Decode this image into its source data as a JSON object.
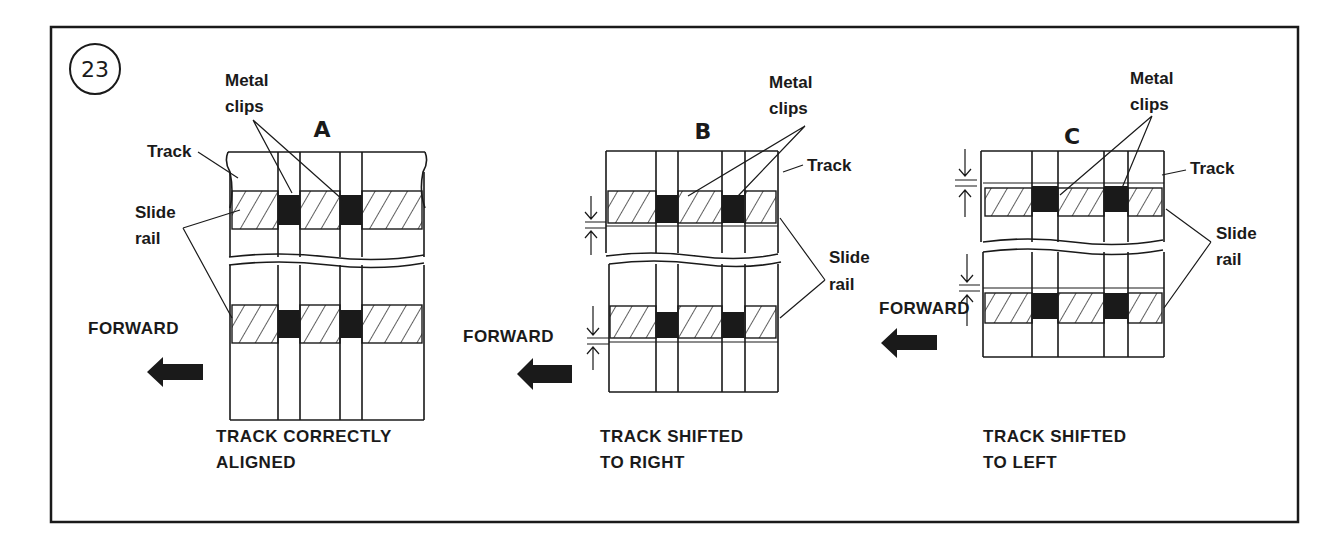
{
  "figure": {
    "number": "23",
    "panels": [
      {
        "letter": "A",
        "labels": {
          "clips_1": "Metal",
          "clips_2": "clips",
          "track": "Track",
          "rail_1": "Slide",
          "rail_2": "rail",
          "forward": "FORWARD"
        },
        "caption_1": "TRACK CORRECTLY",
        "caption_2": "ALIGNED"
      },
      {
        "letter": "B",
        "labels": {
          "clips_1": "Metal",
          "clips_2": "clips",
          "track": "Track",
          "rail_1": "Slide",
          "rail_2": "rail",
          "forward": "FORWARD"
        },
        "caption_1": "TRACK SHIFTED",
        "caption_2": "TO RIGHT"
      },
      {
        "letter": "C",
        "labels": {
          "clips_1": "Metal",
          "clips_2": "clips",
          "track": "Track",
          "rail_1": "Slide",
          "rail_2": "rail",
          "forward": "FORWARD"
        },
        "caption_1": "TRACK SHIFTED",
        "caption_2": "TO LEFT"
      }
    ]
  },
  "colors": {
    "ink": "#1a1a1a",
    "paper": "#ffffff"
  }
}
